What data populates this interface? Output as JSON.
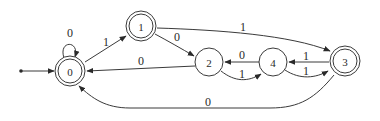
{
  "diagram": {
    "type": "finite-automaton",
    "colors": {
      "stroke": "#3a3a3a",
      "text": "#2a2a2a",
      "background": "#ffffff"
    },
    "start_state": "0",
    "states": [
      {
        "id": "0",
        "label": "0",
        "accepting": true,
        "x": 70,
        "y": 71
      },
      {
        "id": "1",
        "label": "1",
        "accepting": true,
        "x": 141,
        "y": 26
      },
      {
        "id": "2",
        "label": "2",
        "accepting": false,
        "x": 209,
        "y": 62
      },
      {
        "id": "4",
        "label": "4",
        "accepting": false,
        "x": 273,
        "y": 62
      },
      {
        "id": "3",
        "label": "3",
        "accepting": true,
        "x": 345,
        "y": 61
      }
    ],
    "transitions": [
      {
        "from": "0",
        "to": "0",
        "label": "0"
      },
      {
        "from": "0",
        "to": "1",
        "label": "1"
      },
      {
        "from": "1",
        "to": "2",
        "label": "0"
      },
      {
        "from": "1",
        "to": "3",
        "label": "1"
      },
      {
        "from": "2",
        "to": "0",
        "label": "0"
      },
      {
        "from": "2",
        "to": "4",
        "label": "1"
      },
      {
        "from": "4",
        "to": "2",
        "label": "0"
      },
      {
        "from": "4",
        "to": "3",
        "label": "1"
      },
      {
        "from": "3",
        "to": "4",
        "label": "1"
      },
      {
        "from": "3",
        "to": "0",
        "label": "0"
      }
    ]
  }
}
